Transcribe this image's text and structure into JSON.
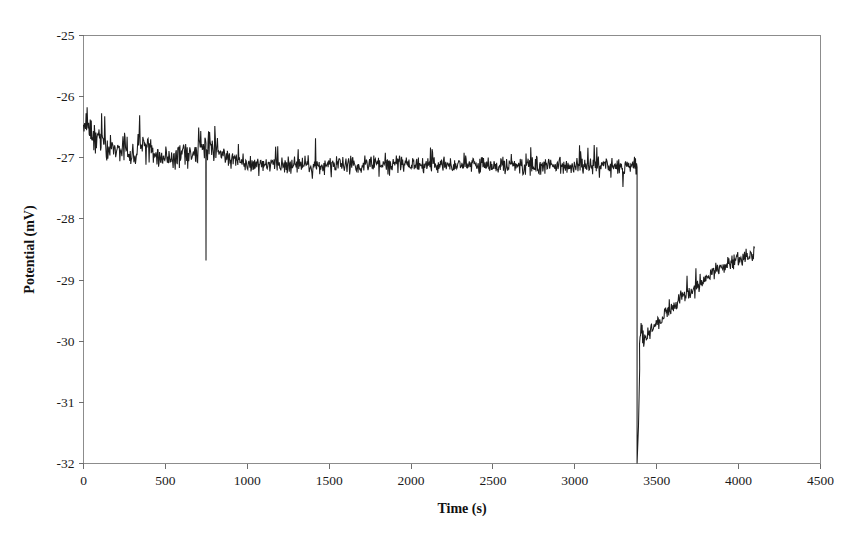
{
  "chart_data": {
    "type": "line",
    "title": "",
    "xlabel": "Time (s)",
    "ylabel": "Potential (mV)",
    "xlim": [
      0,
      4500
    ],
    "ylim": [
      -32,
      -25
    ],
    "xticks": [
      0,
      500,
      1000,
      1500,
      2000,
      2500,
      3000,
      3500,
      4000,
      4500
    ],
    "ytick_labels": [
      "-25",
      "-26",
      "-27",
      "-28",
      "-29",
      "-30",
      "-31",
      "-32"
    ],
    "yticks": [
      -25,
      -26,
      -27,
      -28,
      -29,
      -30,
      -31,
      -32
    ],
    "grid": false,
    "legend": null,
    "series": [
      {
        "name": "Potential",
        "color": "#1c1c1c",
        "description": "Noisy baseline near -27.1 mV until t=3380 s, then a sharp vertical drop to the -32 mV axis limit followed by recovery rising from about -30.1 mV to -28.5 mV by t=4100 s.",
        "baseline_mean_mV": -27.1,
        "noise_band_mV": 0.16,
        "drop_time_s": 3380,
        "drop_bottom_mV": -32,
        "recovery_start_mV": -30.1,
        "recovery_end_mV": -28.55,
        "trace_end_time_s": 4100,
        "spike_events": [
          {
            "time_s": 748,
            "value_mV": -28.68,
            "type": "downward-spike"
          }
        ],
        "segments": [
          {
            "t0": 0,
            "t1": 120,
            "v0": -26.45,
            "v1": -26.75,
            "noise": 0.26
          },
          {
            "t0": 120,
            "t1": 330,
            "v0": -26.75,
            "v1": -27.02,
            "noise": 0.22
          },
          {
            "t0": 330,
            "t1": 420,
            "v0": -26.72,
            "v1": -26.8,
            "noise": 0.2
          },
          {
            "t0": 420,
            "t1": 560,
            "v0": -26.95,
            "v1": -27.02,
            "noise": 0.18
          },
          {
            "t0": 560,
            "t1": 700,
            "v0": -26.98,
            "v1": -26.92,
            "noise": 0.2
          },
          {
            "t0": 700,
            "t1": 840,
            "v0": -26.8,
            "v1": -26.85,
            "noise": 0.22
          },
          {
            "t0": 840,
            "t1": 1000,
            "v0": -26.95,
            "v1": -27.08,
            "noise": 0.18
          },
          {
            "t0": 1000,
            "t1": 1500,
            "v0": -27.12,
            "v1": -27.12,
            "noise": 0.15
          },
          {
            "t0": 1500,
            "t1": 2000,
            "v0": -27.12,
            "v1": -27.1,
            "noise": 0.15
          },
          {
            "t0": 2000,
            "t1": 2500,
            "v0": -27.1,
            "v1": -27.12,
            "noise": 0.15
          },
          {
            "t0": 2500,
            "t1": 3000,
            "v0": -27.12,
            "v1": -27.14,
            "noise": 0.15
          },
          {
            "t0": 3000,
            "t1": 3380,
            "v0": -27.14,
            "v1": -27.15,
            "noise": 0.15
          },
          {
            "t0": 3395,
            "t1": 3500,
            "v0": -30.05,
            "v1": -29.75,
            "noise": 0.14
          },
          {
            "t0": 3500,
            "t1": 3650,
            "v0": -29.72,
            "v1": -29.3,
            "noise": 0.13
          },
          {
            "t0": 3650,
            "t1": 3800,
            "v0": -29.28,
            "v1": -29.0,
            "noise": 0.12
          },
          {
            "t0": 3800,
            "t1": 3950,
            "v0": -28.98,
            "v1": -28.7,
            "noise": 0.14
          },
          {
            "t0": 3950,
            "t1": 4100,
            "v0": -28.72,
            "v1": -28.55,
            "noise": 0.14
          }
        ]
      }
    ]
  }
}
